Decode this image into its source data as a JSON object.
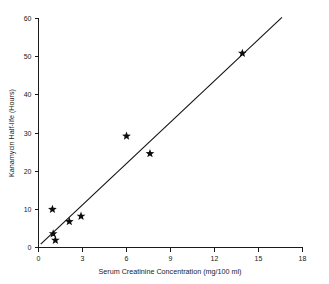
{
  "chart_data": {
    "type": "scatter",
    "title": "",
    "xlabel": "Serum Creatinine Concentration (mg/100 ml)",
    "ylabel": "Kanamycin Half-life (Hours)",
    "xlim": [
      0,
      18
    ],
    "ylim": [
      0,
      60
    ],
    "xticks": [
      0,
      3,
      6,
      9,
      12,
      15,
      18
    ],
    "yticks": [
      0,
      10,
      20,
      30,
      40,
      50,
      60
    ],
    "xtick_labels": [
      "0",
      "3",
      "6",
      "9",
      "12",
      "15",
      "18"
    ],
    "ytick_labels": [
      "0",
      "10",
      "20",
      "30",
      "40",
      "50",
      "60"
    ],
    "grid": false,
    "legend": false,
    "marker": "star",
    "marker_color": "#0d0d0d",
    "line_color": "#111111",
    "points": [
      {
        "x": 0.95,
        "y": 10.0
      },
      {
        "x": 1.0,
        "y": 3.6
      },
      {
        "x": 1.15,
        "y": 1.9
      },
      {
        "x": 2.1,
        "y": 6.8
      },
      {
        "x": 2.9,
        "y": 8.2
      },
      {
        "x": 6.0,
        "y": 29.2
      },
      {
        "x": 7.6,
        "y": 24.6
      },
      {
        "x": 13.9,
        "y": 50.9
      }
    ],
    "fit_line": {
      "label": "regression line",
      "x_start": 0.15,
      "y_start": 0.9,
      "x_end": 16.6,
      "y_end": 60.3
    }
  },
  "axis": {
    "x_label": "Serum Creatinine Concentration (mg/100 ml)",
    "y_label": "Kanamycin Half-life (Hours)"
  }
}
